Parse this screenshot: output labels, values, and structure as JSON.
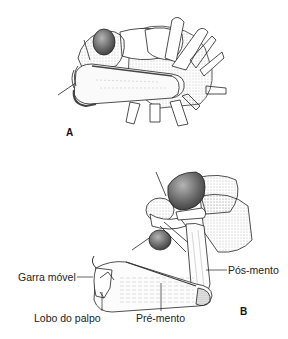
{
  "figure": {
    "type": "scientific-illustration",
    "panels": [
      {
        "id": "A",
        "label": "A",
        "description": "labium folded under head"
      },
      {
        "id": "B",
        "label": "B",
        "description": "labium extended"
      }
    ],
    "annotations": [
      {
        "text": "Garra móvel",
        "panel": "B"
      },
      {
        "text": "Lobo do palpo",
        "panel": "B"
      },
      {
        "text": "Pré-mento",
        "panel": "B"
      },
      {
        "text": "Pós-mento",
        "panel": "B"
      }
    ]
  },
  "colors": {
    "ink": "#222222",
    "shade_dark": "#555555",
    "shade_mid": "#9a9a9a",
    "shade_light": "#d6d6d6",
    "background": "#ffffff"
  }
}
